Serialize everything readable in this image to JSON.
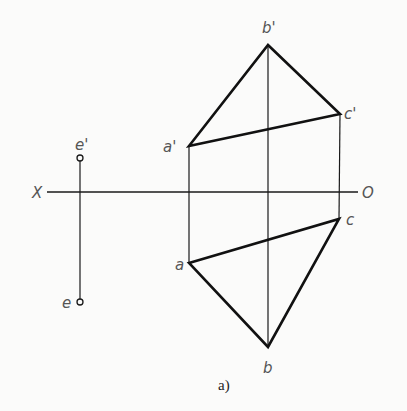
{
  "diagram": {
    "type": "orthographic-projection",
    "caption": "a)",
    "axis": {
      "left_label": "X",
      "right_label": "O",
      "y": 192,
      "x1": 47,
      "x2": 358
    },
    "colors": {
      "stroke": "#1a1a1a",
      "label": "#555555",
      "background": "#fbfbfa"
    },
    "points": {
      "a_prime": {
        "label": "a'",
        "x": 189,
        "y": 146
      },
      "b_prime": {
        "label": "b'",
        "x": 268,
        "y": 45
      },
      "c_prime": {
        "label": "c'",
        "x": 340,
        "y": 114
      },
      "a": {
        "label": "a",
        "x": 189,
        "y": 263
      },
      "b": {
        "label": "b",
        "x": 268,
        "y": 347
      },
      "c": {
        "label": "c",
        "x": 339,
        "y": 219
      },
      "e_prime": {
        "label": "e'",
        "x": 80,
        "y": 158
      },
      "e": {
        "label": "e",
        "x": 80,
        "y": 302
      }
    },
    "triangles": [
      {
        "name": "front-view-abc",
        "vertices": [
          "a'",
          "b'",
          "c'"
        ]
      },
      {
        "name": "top-view-abc",
        "vertices": [
          "a",
          "b",
          "c"
        ]
      }
    ],
    "projection_lines": [
      {
        "from": "a'",
        "to": "a"
      },
      {
        "from": "b'",
        "to": "b"
      },
      {
        "from": "c'",
        "to": "c"
      },
      {
        "from": "e'",
        "to": "e"
      }
    ]
  }
}
